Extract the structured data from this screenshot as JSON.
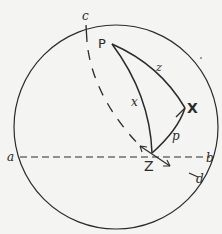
{
  "diagram": {
    "labels": {
      "c": "c",
      "P": "P",
      "z": "z",
      "x": "x",
      "X": "X",
      "p": "p",
      "Z": "Z",
      "a": "a",
      "b": "b",
      "d": "d"
    },
    "colors": {
      "stroke": "#2a2a2a",
      "background": "#f4f4f2"
    },
    "circle": {
      "cx": 116,
      "cy": 128,
      "r": 102
    }
  }
}
